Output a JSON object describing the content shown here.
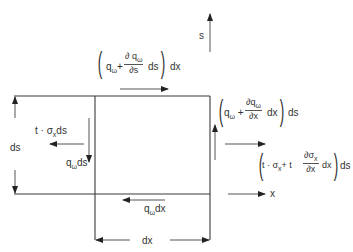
{
  "axes": {
    "s_label": "s",
    "x_label": "x"
  },
  "dimensions": {
    "ds": "ds",
    "dx": "dx"
  },
  "forces": {
    "top": {
      "q": "q",
      "q_sub": "ω",
      "plus": "+",
      "d_num": "∂ q",
      "d_num_sub": "ω",
      "d_den": "∂s",
      "times": "ds",
      "outer": "dx"
    },
    "right_shear": {
      "q": "q",
      "q_sub": "ω",
      "plus": "+",
      "d_num": "∂q",
      "d_num_sub": "ω",
      "d_den": "∂x",
      "times": "dx",
      "outer": "ds"
    },
    "right_normal": {
      "prefix": "t · σ",
      "prefix_sub": "x",
      "plus_t": "+ t",
      "d_num": "∂σ",
      "d_num_sub": "x",
      "d_den": "∂x",
      "times": "dx",
      "outer": "ds"
    },
    "left_normal": {
      "text": "t · σ",
      "sub": "x",
      "suffix": "ds"
    },
    "left_shear": {
      "q": "q",
      "sub": "ω",
      "suffix": "ds"
    },
    "bottom_shear": {
      "q": "q",
      "sub": "ω",
      "suffix": "dx"
    }
  },
  "colors": {
    "line": "#3a3a3a",
    "text": "#333333",
    "background": "#ffffff"
  }
}
